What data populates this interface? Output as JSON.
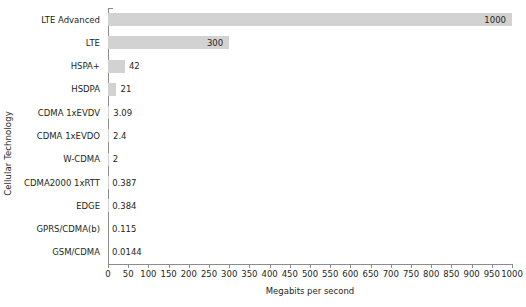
{
  "chart_data": {
    "type": "bar",
    "orientation": "horizontal",
    "title": "",
    "xlabel": "Megabits per second",
    "ylabel": "Cellular Technology",
    "categories": [
      "LTE Advanced",
      "LTE",
      "HSPA+",
      "HSDPA",
      "CDMA 1xEVDV",
      "CDMA 1xEVDO",
      "W-CDMA",
      "CDMA2000 1xRTT",
      "EDGE",
      "GPRS/CDMA(b)",
      "GSM/CDMA"
    ],
    "values": [
      1000,
      300,
      42,
      21,
      3.09,
      2.4,
      2,
      0.387,
      0.384,
      0.115,
      0.0144
    ],
    "value_labels": [
      "1000",
      "300",
      "42",
      "21",
      "3.09",
      "2.4",
      "2",
      "0.387",
      "0.384",
      "0.115",
      "0.0144"
    ],
    "xlim": [
      0,
      1000
    ],
    "xticks": [
      0,
      50,
      100,
      150,
      200,
      250,
      300,
      350,
      400,
      450,
      500,
      550,
      600,
      650,
      700,
      750,
      800,
      850,
      900,
      950,
      1000
    ],
    "xtick_labels": [
      "0",
      "50",
      "100",
      "150",
      "200",
      "250",
      "300",
      "350",
      "400",
      "450",
      "500",
      "550",
      "600",
      "650",
      "700",
      "750",
      "800",
      "850",
      "900",
      "950",
      "1000"
    ],
    "grid": false,
    "legend": false,
    "bar_color": "#d2d2d2",
    "axis_color": "#8c8c8c",
    "text_color": "#231f20"
  }
}
